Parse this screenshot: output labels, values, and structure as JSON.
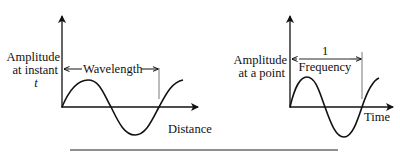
{
  "diagrams": [
    {
      "name": "wavelength-diagram",
      "y_axis_label_lines": [
        "Amplitude",
        "at instant",
        "t"
      ],
      "x_axis_label": "Distance",
      "span_label": "Wavelength"
    },
    {
      "name": "frequency-diagram",
      "y_axis_label_lines": [
        "Amplitude",
        "at a point"
      ],
      "x_axis_label": "Time",
      "span_numerator": "1",
      "span_denominator": "Frequency"
    }
  ],
  "colors": {
    "stroke": "#111111",
    "background": "#ffffff"
  }
}
